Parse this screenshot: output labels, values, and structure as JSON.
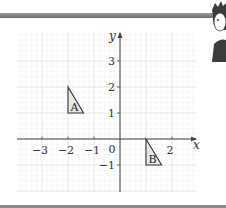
{
  "figure": {
    "x_axis_label": "x",
    "y_axis_label": "y",
    "origin_label": "0",
    "x_ticks": [
      {
        "value": -3,
        "label": "−3"
      },
      {
        "value": -2,
        "label": "−2"
      },
      {
        "value": -1,
        "label": "−1"
      },
      {
        "value": 2,
        "label": "2"
      }
    ],
    "y_ticks": [
      {
        "value": 3,
        "label": "3"
      },
      {
        "value": 2,
        "label": "2"
      },
      {
        "value": 1,
        "label": "1"
      },
      {
        "value": -1,
        "label": "−1"
      }
    ],
    "shapes": [
      {
        "name": "A",
        "label": "A",
        "vertices": [
          [
            -2,
            2
          ],
          [
            -2,
            1
          ],
          [
            -1.4,
            1
          ]
        ]
      },
      {
        "name": "B",
        "label": "B",
        "vertices": [
          [
            1,
            0
          ],
          [
            1,
            -1
          ],
          [
            1.6,
            -1
          ]
        ]
      }
    ],
    "colors": {
      "grid": "#e4e4e4",
      "axis": "#444444",
      "shape_fill": "#e8e8e8",
      "shape_stroke": "#333333"
    }
  },
  "mascot": {
    "icon": "cartoon-character-icon"
  }
}
